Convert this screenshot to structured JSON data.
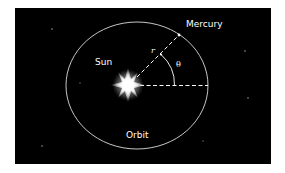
{
  "diagram": {
    "background_color": "#000000",
    "foreground_color": "#ffffff",
    "labels": {
      "mercury": "Mercury",
      "sun": "Sun",
      "orbit": "Orbit",
      "radius": "r",
      "angle": "θ"
    },
    "elements": [
      "orbit-ellipse",
      "sun",
      "mercury",
      "radius-vector-r",
      "reference-axis",
      "angle-arc-theta"
    ]
  }
}
